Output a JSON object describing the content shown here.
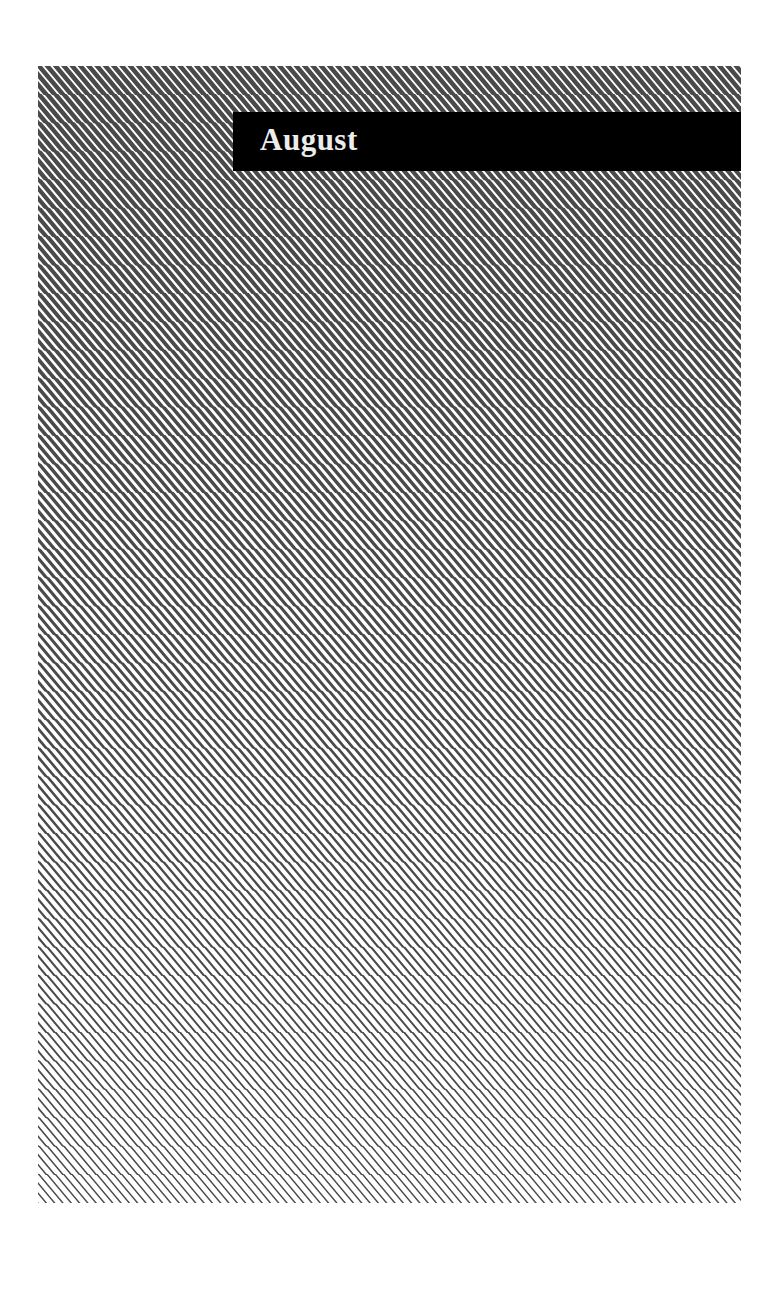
{
  "label": {
    "text": "August",
    "background_color": "#000000",
    "text_color": "#ececec"
  },
  "artwork": {
    "pattern": "diagonal-stripes",
    "stripe_color": "#4a4a4a",
    "background_color": "#ffffff",
    "stripe_angle_deg": 50,
    "horizontal_period_px": 8.3,
    "duty_top": 0.72,
    "duty_bottom": 0.22
  }
}
